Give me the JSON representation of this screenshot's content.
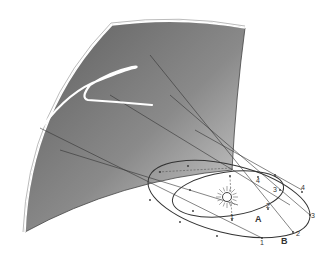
{
  "diagram": {
    "surface": {
      "name": "celestial-sphere-section",
      "fill_dark": "#6f6f6f",
      "fill_light": "#c9c9c9",
      "edge": "#ffffff"
    },
    "sun": {
      "label": "",
      "color": "#555555"
    },
    "orbits": [
      {
        "id": "A",
        "label": "A",
        "positions": [
          "1",
          "2",
          "3",
          "4"
        ]
      },
      {
        "id": "B",
        "label": "B",
        "positions": [
          "1",
          "2",
          "3",
          "4"
        ]
      }
    ],
    "apparent_path": {
      "name": "retrograde-loop",
      "color": "#ffffff"
    }
  }
}
